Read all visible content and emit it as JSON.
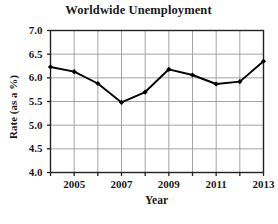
{
  "chart_data": {
    "type": "line",
    "title": "Worldwide Unemployment",
    "xlabel": "Year",
    "ylabel": "Rate (as a %)",
    "x": [
      2004,
      2005,
      2006,
      2007,
      2008,
      2009,
      2010,
      2011,
      2012,
      2013
    ],
    "values": [
      6.23,
      6.13,
      5.88,
      5.48,
      5.7,
      6.18,
      6.06,
      5.87,
      5.92,
      6.35
    ],
    "series": [
      {
        "name": "Unemployment rate",
        "values": [
          6.23,
          6.13,
          5.88,
          5.48,
          5.7,
          6.18,
          6.06,
          5.87,
          5.92,
          6.35
        ]
      }
    ],
    "xlim": [
      2004,
      2013
    ],
    "ylim": [
      4.0,
      7.0
    ],
    "y_ticks": [
      7.0,
      6.5,
      6.0,
      5.5,
      5.0,
      4.5,
      4.0
    ],
    "y_tick_labels": [
      "7.0",
      "6.5",
      "6.0",
      "5.5",
      "5.0",
      "4.5",
      "4.0"
    ],
    "x_ticks": [
      2004,
      2005,
      2006,
      2007,
      2008,
      2009,
      2010,
      2011,
      2012,
      2013
    ],
    "x_tick_labels": [
      "",
      "2005",
      "",
      "2007",
      "",
      "2009",
      "",
      "2011",
      "",
      "2013"
    ],
    "grid": true,
    "legend": false,
    "line_color": "#000000",
    "marker": "diamond",
    "marker_color": "#000000",
    "grid_color": "#9a9a9a",
    "axis_color": "#222222",
    "background": "#ffffff"
  }
}
